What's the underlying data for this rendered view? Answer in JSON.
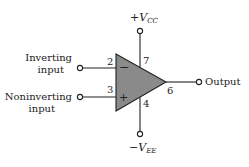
{
  "diagram": {
    "supply_positive": {
      "sign": "+",
      "symbol": "V",
      "subscript": "CC",
      "pin": "7"
    },
    "supply_negative": {
      "sign": "−",
      "symbol": "V",
      "subscript": "EE",
      "pin": "4"
    },
    "inverting_input": {
      "label_line1": "Inverting",
      "label_line2": "input",
      "pin": "2",
      "sign": "−"
    },
    "noninverting_input": {
      "label_line1": "Noninverting",
      "label_line2": "input",
      "pin": "3",
      "sign": "+"
    },
    "output": {
      "label": "Output",
      "pin": "6"
    },
    "colors": {
      "body_fill": "#8a8a8a",
      "stroke": "#222222"
    }
  }
}
